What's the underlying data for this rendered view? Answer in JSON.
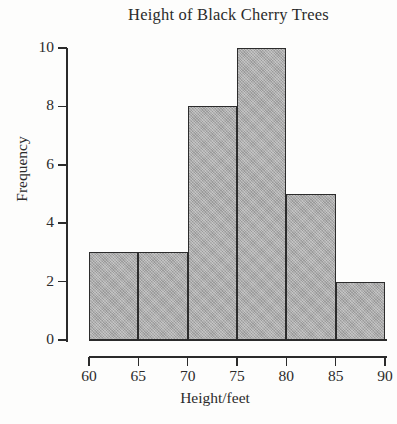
{
  "chart_data": {
    "type": "bar",
    "title": "Height of Black Cherry Trees",
    "xlabel": "Height/feet",
    "ylabel": "Frequency",
    "categories": [
      "60-65",
      "65-70",
      "70-75",
      "75-80",
      "80-85",
      "85-90"
    ],
    "bin_edges": [
      60,
      65,
      70,
      75,
      80,
      85,
      90
    ],
    "values": [
      3,
      3,
      8,
      10,
      5,
      2
    ],
    "xlim": [
      60,
      90
    ],
    "ylim": [
      0,
      10
    ],
    "xticks": [
      60,
      65,
      70,
      75,
      80,
      85,
      90
    ],
    "xtick_labels": [
      "60",
      "65",
      "70",
      "75",
      "80",
      "85",
      "90"
    ],
    "yticks": [
      0,
      2,
      4,
      6,
      8,
      10
    ],
    "ytick_labels": [
      "0",
      "2",
      "4",
      "6",
      "8",
      "10"
    ],
    "grid": false,
    "legend": false,
    "legend_position": "none",
    "bar_fill_color": "#a9a9a9",
    "bar_border_color": "#2c2c2c",
    "axis_color": "#2b2b2b",
    "background_color": "#fdfdfc"
  }
}
